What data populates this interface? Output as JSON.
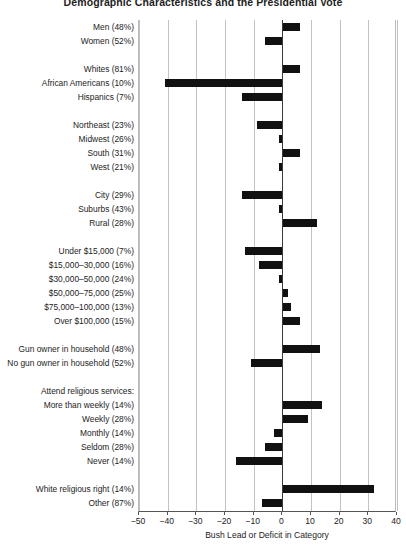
{
  "chart_data": {
    "type": "bar",
    "orientation": "horizontal",
    "title": "Demographic Characteristics and the Presidential Vote",
    "xlabel": "Bush Lead or Deficit in Category",
    "ylabel": "",
    "xlim": [
      -50,
      40
    ],
    "xticks": [
      -50,
      -40,
      -30,
      -20,
      -10,
      0,
      10,
      20,
      30,
      40
    ],
    "xticklabels": [
      "−50",
      "−40",
      "−30",
      "−20",
      "−10",
      "0",
      "10",
      "20",
      "30",
      "40"
    ],
    "grid": "vertical",
    "legend": "none",
    "zero_reference_line": true,
    "bar_color": "#111111",
    "groups": [
      {
        "name": "gender",
        "heading": null,
        "categories": [
          "Men (48%)",
          "Women (52%)"
        ],
        "values": [
          6,
          -6
        ]
      },
      {
        "name": "race",
        "heading": null,
        "categories": [
          "Whites (81%)",
          "African Americans (10%)",
          "Hispanics (7%)"
        ],
        "values": [
          6,
          -41,
          -14
        ]
      },
      {
        "name": "region",
        "heading": null,
        "categories": [
          "Northeast (23%)",
          "Midwest (26%)",
          "South (31%)",
          "West (21%)"
        ],
        "values": [
          -9,
          -1,
          6,
          -1
        ]
      },
      {
        "name": "community",
        "heading": null,
        "categories": [
          "City (29%)",
          "Suburbs (43%)",
          "Rural (28%)"
        ],
        "values": [
          -14,
          -1,
          12
        ]
      },
      {
        "name": "income",
        "heading": null,
        "categories": [
          "Under $15,000 (7%)",
          "$15,000–30,000 (16%)",
          "$30,000–50,000 (24%)",
          "$50,000–75,000 (25%)",
          "$75,000–100,000 (13%)",
          "Over $100,000 (15%)"
        ],
        "values": [
          -13,
          -8,
          -1,
          2,
          3,
          6
        ]
      },
      {
        "name": "gun-ownership",
        "heading": null,
        "categories": [
          "Gun owner in household (48%)",
          "No gun owner in household (52%)"
        ],
        "values": [
          13,
          -11
        ]
      },
      {
        "name": "religious-attendance",
        "heading": "Attend religious services:",
        "categories": [
          "More than weekly (14%)",
          "Weekly (28%)",
          "Monthly (14%)",
          "Seldom (28%)",
          "Never (14%)"
        ],
        "values": [
          14,
          9,
          -3,
          -6,
          -16
        ]
      },
      {
        "name": "religious-right",
        "heading": null,
        "categories": [
          "White religious right (14%)",
          "Other (87%)"
        ],
        "values": [
          32,
          -7
        ]
      }
    ]
  }
}
